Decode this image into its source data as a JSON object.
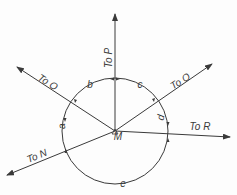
{
  "diagram": {
    "title": "",
    "center_label": "M",
    "rays": [
      {
        "id": "P",
        "label": "To P",
        "angle_deg": 90
      },
      {
        "id": "O-left",
        "label": "To O",
        "angle_deg": 155
      },
      {
        "id": "O-right",
        "label": "To O",
        "angle_deg": 30
      },
      {
        "id": "R",
        "label": "To R",
        "angle_deg": -5
      },
      {
        "id": "N",
        "label": "To N",
        "angle_deg": 200
      }
    ],
    "arcs": [
      {
        "id": "b",
        "label": "b"
      },
      {
        "id": "c",
        "label": "c"
      },
      {
        "id": "d",
        "label": "d"
      },
      {
        "id": "a",
        "label": "a"
      },
      {
        "id": "e",
        "label": "e"
      }
    ],
    "colors": {
      "line": "#3a3a3a",
      "background": "#fdfdfd"
    }
  }
}
